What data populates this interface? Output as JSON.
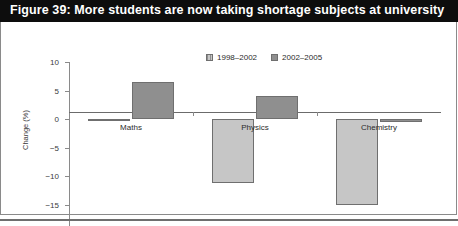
{
  "figure": {
    "title": "Figure 39: More students are now taking shortage subjects at university"
  },
  "chart_data": {
    "type": "bar",
    "title": "Figure 39: More students are now taking shortage subjects at university",
    "xlabel": "",
    "ylabel": "Change (%)",
    "categories": [
      "Maths",
      "Physics",
      "Chemistry"
    ],
    "series": [
      {
        "name": "1998–2002",
        "color": "#c6c6c6",
        "values": [
          -0.1,
          -11.2,
          -15.1
        ]
      },
      {
        "name": "2002–2005",
        "color": "#8f8f8f",
        "values": [
          6.5,
          4.0,
          -0.5
        ]
      }
    ],
    "ylim": [
      -20,
      10
    ],
    "yticks": [
      10,
      5,
      0,
      -5,
      -10,
      -15,
      -20
    ],
    "ytick_labels": [
      "10",
      "5",
      "0",
      "−5",
      "−10",
      "−15",
      "−20"
    ],
    "grid": false,
    "legend_position": "top-center",
    "zero_line": true
  }
}
